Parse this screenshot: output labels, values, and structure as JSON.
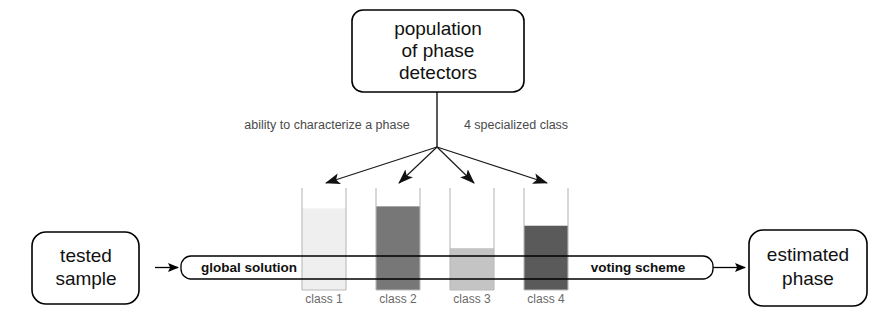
{
  "diagram": {
    "nodes": {
      "population": {
        "line1": "population",
        "line2": "of phase",
        "line3": "detectors"
      },
      "tested_sample": {
        "line1": "tested",
        "line2": "sample"
      },
      "estimated_phase": {
        "line1": "estimated",
        "line2": "phase"
      }
    },
    "annotations": {
      "left": "ability to characterize a phase",
      "right": "4 specialized class"
    },
    "bar": {
      "left_label": "global solution",
      "right_label": "voting scheme"
    },
    "classes": [
      {
        "label": "class 1",
        "fill_ratio": 0.8,
        "color": "#efefef"
      },
      {
        "label": "class 2",
        "fill_ratio": 0.82,
        "color": "#777777"
      },
      {
        "label": "class 3",
        "fill_ratio": 0.41,
        "color": "#c4c4c4"
      },
      {
        "label": "class 4",
        "fill_ratio": 0.63,
        "color": "#5a5a5a"
      }
    ],
    "colors": {
      "stroke": "#000000",
      "beaker_wall": "#b9b9b9",
      "annotation_text": "#4a4a4a",
      "class_label_text": "#6a6a6a",
      "background": "#ffffff"
    }
  }
}
